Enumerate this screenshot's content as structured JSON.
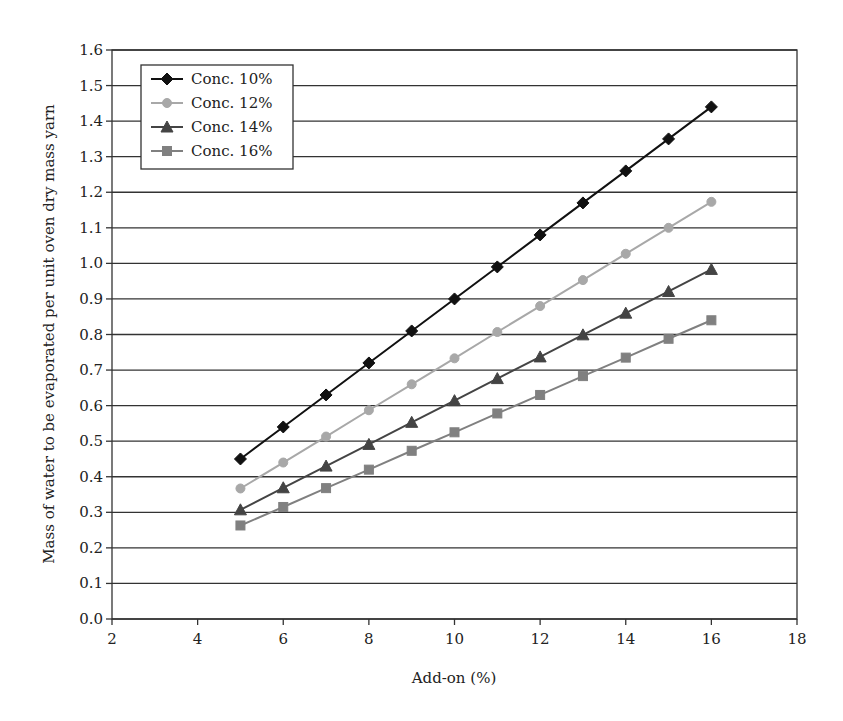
{
  "chart_data": {
    "type": "line",
    "title": "",
    "xlabel": "Add-on (%)",
    "ylabel": "Mass of water to be evaporated per unit oven dry mass yarn",
    "xlim": [
      2,
      18
    ],
    "ylim": [
      0.0,
      1.6
    ],
    "xticks": [
      "2",
      "4",
      "6",
      "8",
      "10",
      "12",
      "14",
      "16",
      "18"
    ],
    "yticks": [
      "0.0",
      "0.1",
      "0.2",
      "0.3",
      "0.4",
      "0.5",
      "0.6",
      "0.7",
      "0.8",
      "0.9",
      "1.0",
      "1.1",
      "1.2",
      "1.3",
      "1.4",
      "1.5",
      "1.6"
    ],
    "grid": "horizontal",
    "legend_position": "upper-left",
    "x": [
      5,
      6,
      7,
      8,
      9,
      10,
      11,
      12,
      13,
      14,
      15,
      16
    ],
    "series": [
      {
        "name": "Conc. 10%",
        "marker": "diamond",
        "color": "#111111",
        "values": [
          0.45,
          0.54,
          0.63,
          0.72,
          0.81,
          0.9,
          0.99,
          1.08,
          1.17,
          1.26,
          1.35,
          1.44
        ]
      },
      {
        "name": "Conc. 12%",
        "marker": "circle",
        "color": "#a8a8a8",
        "values": [
          0.367,
          0.44,
          0.513,
          0.587,
          0.66,
          0.733,
          0.807,
          0.88,
          0.953,
          1.027,
          1.1,
          1.173
        ]
      },
      {
        "name": "Conc. 14%",
        "marker": "triangle",
        "color": "#444444",
        "values": [
          0.307,
          0.369,
          0.43,
          0.491,
          0.553,
          0.614,
          0.676,
          0.737,
          0.799,
          0.86,
          0.921,
          0.983
        ]
      },
      {
        "name": "Conc. 16%",
        "marker": "square",
        "color": "#808080",
        "values": [
          0.263,
          0.315,
          0.368,
          0.42,
          0.473,
          0.525,
          0.578,
          0.63,
          0.683,
          0.735,
          0.788,
          0.84
        ]
      }
    ]
  }
}
